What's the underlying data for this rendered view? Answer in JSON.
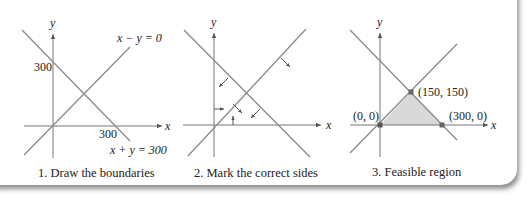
{
  "panels": [
    {
      "caption": "1. Draw the boundaries",
      "axis_x_label": "x",
      "axis_y_label": "y",
      "y_intercept_label": "300",
      "x_intercept_label": "300",
      "line1_label": "x − y = 0",
      "line2_label": "x + y = 300"
    },
    {
      "caption": "2. Mark the correct sides",
      "axis_x_label": "x",
      "axis_y_label": "y"
    },
    {
      "caption": "3. Feasible region",
      "axis_x_label": "x",
      "axis_y_label": "y",
      "vertices": [
        "(0, 0)",
        "(150, 150)",
        "(300, 0)"
      ]
    }
  ],
  "colors": {
    "line": "#8a8a8a",
    "axis": "#777777",
    "region_fill": "#d9d9d9",
    "vertex": "#666666",
    "text": "#222222"
  }
}
